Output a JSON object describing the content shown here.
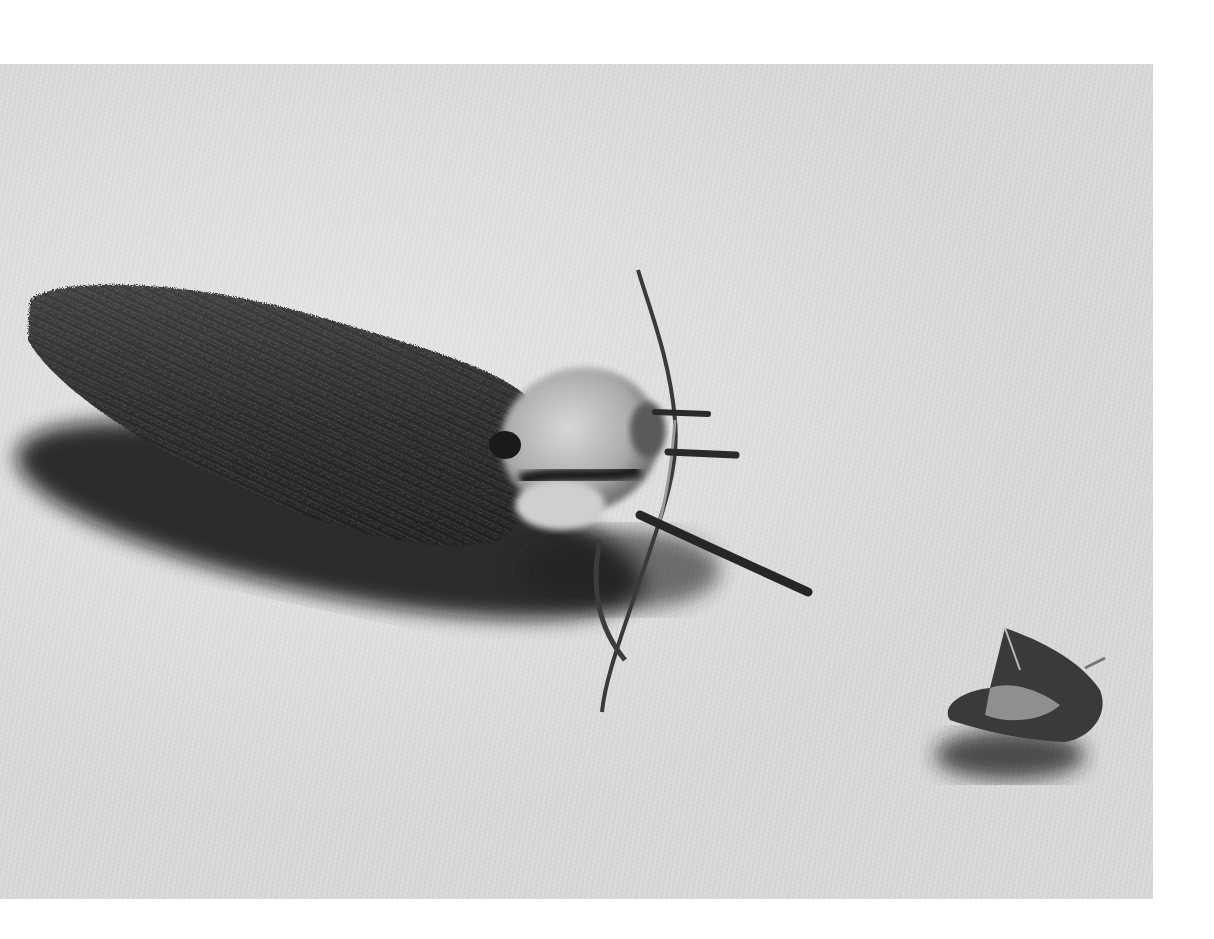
{
  "image": {
    "kind": "black-and-white photograph",
    "background_surface": "light gray fibrous fabric",
    "margin_color": "#ffffff",
    "surface_color": "#d9d9d9",
    "subjects": [
      {
        "name": "hairy-cocoon-case",
        "color": "#2a2a2a",
        "position": "left-center"
      },
      {
        "name": "moth",
        "color": "#bdbdbd",
        "position": "center",
        "note": "pale furry thorax with long antennae and dark legs, emerging from the case"
      },
      {
        "name": "shell-fragment",
        "color": "#3a3a3a",
        "position": "lower-right"
      }
    ]
  }
}
